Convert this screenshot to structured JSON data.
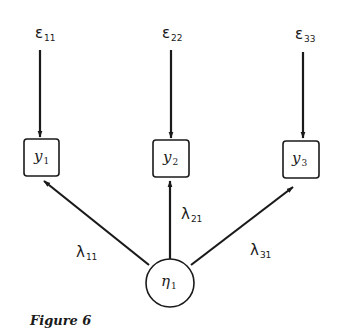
{
  "errors": [
    {
      "symbol": "ε",
      "sub": "11"
    },
    {
      "symbol": "ε",
      "sub": "22"
    },
    {
      "symbol": "ε",
      "sub": "33"
    }
  ],
  "observed": [
    {
      "symbol": "y",
      "sub": "1"
    },
    {
      "symbol": "y",
      "sub": "2"
    },
    {
      "symbol": "y",
      "sub": "3"
    }
  ],
  "latent": {
    "symbol": "η",
    "sub": "1"
  },
  "loadings": [
    {
      "symbol": "λ",
      "sub": "11"
    },
    {
      "symbol": "λ",
      "sub": "21"
    },
    {
      "symbol": "λ",
      "sub": "31"
    }
  ],
  "caption": "Figure 6",
  "colors": {
    "ink": "#1a1a1a",
    "background": "#ffffff"
  }
}
